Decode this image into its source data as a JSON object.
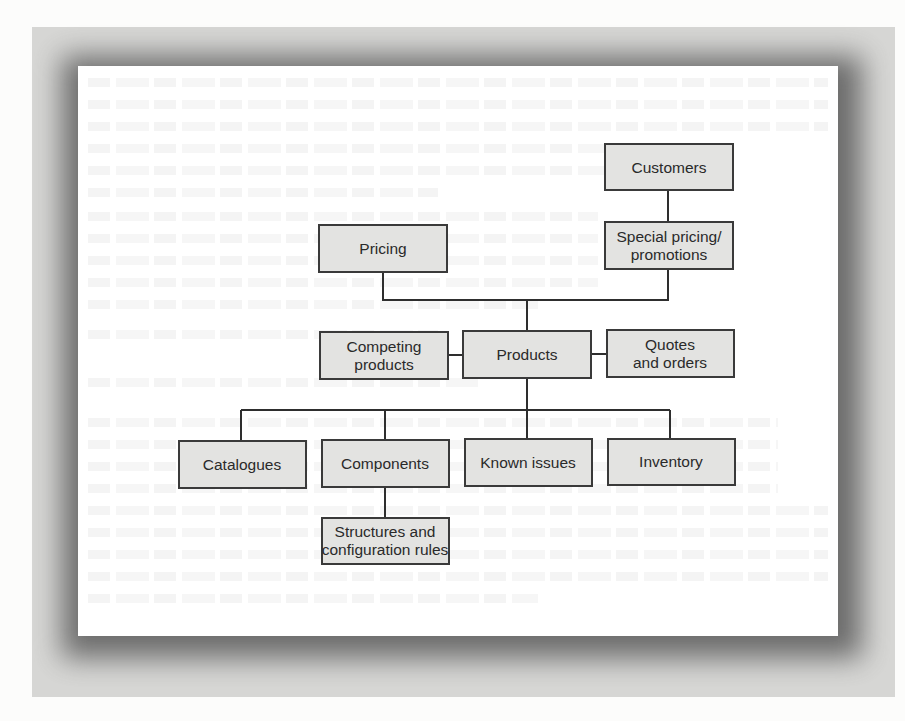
{
  "diagram": {
    "colors": {
      "box_fill": "#e3e3e1",
      "box_border": "#3a3a3a",
      "connector": "#2e2e2e",
      "text": "#2a2a2a",
      "panel": "#d6d6d4",
      "card": "#ffffff"
    },
    "nodes": [
      {
        "id": "customers",
        "lines": [
          "Customers"
        ]
      },
      {
        "id": "special-pricing",
        "lines": [
          "Special pricing/",
          "promotions"
        ]
      },
      {
        "id": "pricing",
        "lines": [
          "Pricing"
        ]
      },
      {
        "id": "competing-products",
        "lines": [
          "Competing",
          "products"
        ]
      },
      {
        "id": "products",
        "lines": [
          "Products"
        ]
      },
      {
        "id": "quotes-orders",
        "lines": [
          "Quotes",
          "and orders"
        ]
      },
      {
        "id": "catalogues",
        "lines": [
          "Catalogues"
        ]
      },
      {
        "id": "components",
        "lines": [
          "Components"
        ]
      },
      {
        "id": "known-issues",
        "lines": [
          "Known issues"
        ]
      },
      {
        "id": "inventory",
        "lines": [
          "Inventory"
        ]
      },
      {
        "id": "structures",
        "lines": [
          "Structures and",
          "configuration rules"
        ]
      }
    ],
    "edges": [
      {
        "from": "customers",
        "to": "special-pricing"
      },
      {
        "from": "pricing",
        "to": "products"
      },
      {
        "from": "special-pricing",
        "to": "products"
      },
      {
        "from": "competing-products",
        "to": "products"
      },
      {
        "from": "products",
        "to": "quotes-orders"
      },
      {
        "from": "products",
        "to": "catalogues"
      },
      {
        "from": "products",
        "to": "components"
      },
      {
        "from": "products",
        "to": "known-issues"
      },
      {
        "from": "products",
        "to": "inventory"
      },
      {
        "from": "components",
        "to": "structures"
      }
    ]
  }
}
